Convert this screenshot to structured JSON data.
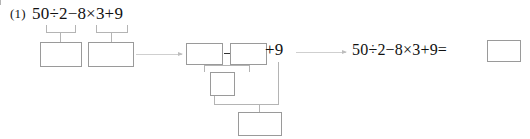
{
  "problem": {
    "number": "(1)",
    "expression": "50÷2−8×3+9"
  },
  "step_brackets": [
    {
      "group": "50÷2"
    },
    {
      "group": "8×3"
    }
  ],
  "boxes": {
    "step1_left": "",
    "step1_right": "",
    "step2_left": "",
    "step2_right": "",
    "step3_middle": "",
    "step4_bottom": "",
    "answer": ""
  },
  "operators": {
    "minus": "−",
    "plus_nine": "+9"
  },
  "final": {
    "expression": "50÷2−8×3+9="
  },
  "arrows": {
    "first": "arrow-right",
    "second": "arrow-right"
  }
}
